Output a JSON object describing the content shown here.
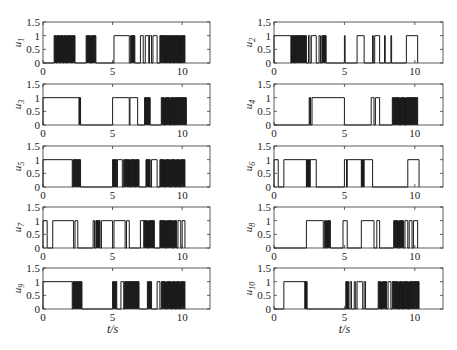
{
  "chart_data": {
    "type": "line",
    "layout": "5x2 grid of step-signal subplots",
    "xlabel": "t/s",
    "xlim": [
      0,
      12
    ],
    "ylim": [
      0,
      1.5
    ],
    "xticks": [
      0,
      5,
      10
    ],
    "xtick_labels": [
      "0",
      "5",
      "10"
    ],
    "yticks": [
      0,
      0.5,
      1,
      1.5
    ],
    "ytick_labels": [
      "0",
      "0.5",
      "1",
      "1.5"
    ],
    "grid": false,
    "legend": null,
    "colors": {
      "line": "#1a1a1a",
      "axes": "#333333",
      "background": "#ffffff"
    },
    "subplots": [
      {
        "ylabel": "u",
        "sub": "1",
        "col": 0,
        "row": 0,
        "on_intervals": [
          [
            0.8,
            0.95
          ],
          [
            1.0,
            1.15
          ],
          [
            1.2,
            1.45
          ],
          [
            1.5,
            1.7
          ],
          [
            1.75,
            2.05
          ],
          [
            2.1,
            2.3
          ],
          [
            3.1,
            3.4
          ],
          [
            3.5,
            3.8
          ],
          [
            5.1,
            6.2
          ],
          [
            6.3,
            6.6
          ],
          [
            7.0,
            7.2
          ],
          [
            7.35,
            7.6
          ],
          [
            7.65,
            7.8
          ],
          [
            7.9,
            8.2
          ],
          [
            8.4,
            8.8
          ],
          [
            8.85,
            9.1
          ],
          [
            9.15,
            9.4
          ],
          [
            9.45,
            9.7
          ],
          [
            9.75,
            9.9
          ],
          [
            9.95,
            10.2
          ]
        ],
        "dense_intervals": [
          [
            0.8,
            2.3
          ],
          [
            3.1,
            3.8
          ],
          [
            6.3,
            6.6
          ],
          [
            8.4,
            10.2
          ]
        ]
      },
      {
        "ylabel": "u",
        "sub": "2",
        "col": 1,
        "row": 0,
        "on_intervals": [
          [
            0,
            1.2
          ],
          [
            1.25,
            1.45
          ],
          [
            1.5,
            2.3
          ],
          [
            2.45,
            2.55
          ],
          [
            2.65,
            3.0
          ],
          [
            3.2,
            3.3
          ],
          [
            3.4,
            3.7
          ],
          [
            5.0,
            5.05
          ],
          [
            5.9,
            6.4
          ],
          [
            7.0,
            7.05
          ],
          [
            7.15,
            7.5
          ],
          [
            7.85,
            7.9
          ],
          [
            8.3,
            8.35
          ],
          [
            9.4,
            10.2
          ]
        ],
        "dense_intervals": [
          [
            1.2,
            2.3
          ],
          [
            3.4,
            3.7
          ]
        ]
      },
      {
        "ylabel": "u",
        "sub": "3",
        "col": 0,
        "row": 1,
        "on_intervals": [
          [
            0,
            2.6
          ],
          [
            2.6,
            2.7
          ],
          [
            5.0,
            6.2
          ],
          [
            6.25,
            6.8
          ],
          [
            7.3,
            7.7
          ],
          [
            8.5,
            8.7
          ],
          [
            8.8,
            9.1
          ],
          [
            9.2,
            9.4
          ],
          [
            9.45,
            10.3
          ]
        ],
        "dense_intervals": [
          [
            2.6,
            2.7
          ],
          [
            7.3,
            7.7
          ],
          [
            8.5,
            10.3
          ]
        ]
      },
      {
        "ylabel": "u",
        "sub": "4",
        "col": 1,
        "row": 1,
        "on_intervals": [
          [
            2.5,
            2.6
          ],
          [
            2.7,
            5.0
          ],
          [
            6.9,
            7.1
          ],
          [
            7.2,
            7.5
          ],
          [
            8.4,
            8.9
          ],
          [
            9.0,
            9.3
          ],
          [
            9.4,
            10.2
          ]
        ],
        "dense_intervals": [
          [
            2.5,
            2.6
          ],
          [
            8.4,
            10.2
          ]
        ]
      },
      {
        "ylabel": "u",
        "sub": "5",
        "col": 0,
        "row": 2,
        "on_intervals": [
          [
            0,
            2.1
          ],
          [
            2.15,
            2.7
          ],
          [
            5.0,
            5.3
          ],
          [
            5.35,
            5.7
          ],
          [
            5.8,
            6.2
          ],
          [
            6.3,
            6.6
          ],
          [
            6.65,
            6.9
          ],
          [
            7.4,
            7.7
          ],
          [
            7.8,
            8.2
          ],
          [
            8.4,
            8.7
          ],
          [
            8.8,
            9.1
          ],
          [
            9.2,
            9.5
          ],
          [
            9.6,
            9.8
          ],
          [
            9.9,
            10.2
          ]
        ],
        "dense_intervals": [
          [
            2.15,
            2.7
          ],
          [
            5.0,
            5.3
          ],
          [
            5.8,
            6.9
          ],
          [
            7.4,
            7.7
          ],
          [
            8.4,
            10.2
          ]
        ]
      },
      {
        "ylabel": "u",
        "sub": "6",
        "col": 1,
        "row": 2,
        "on_intervals": [
          [
            0,
            0.3
          ],
          [
            0.7,
            2.3
          ],
          [
            2.35,
            2.5
          ],
          [
            2.55,
            3.0
          ],
          [
            5.0,
            5.15
          ],
          [
            5.2,
            6.2
          ],
          [
            6.25,
            6.35
          ],
          [
            6.4,
            7.0
          ],
          [
            9.5,
            10.3
          ]
        ],
        "dense_intervals": [
          [
            2.3,
            2.6
          ],
          [
            6.2,
            6.4
          ]
        ]
      },
      {
        "ylabel": "u",
        "sub": "7",
        "col": 0,
        "row": 3,
        "on_intervals": [
          [
            0,
            0.3
          ],
          [
            0.7,
            2.2
          ],
          [
            2.3,
            2.5
          ],
          [
            3.6,
            3.7
          ],
          [
            3.8,
            4.1
          ],
          [
            4.2,
            5.0
          ],
          [
            5.1,
            5.9
          ],
          [
            6.0,
            6.2
          ],
          [
            7.0,
            7.5
          ],
          [
            7.6,
            8.0
          ],
          [
            8.4,
            8.8
          ],
          [
            8.9,
            9.3
          ],
          [
            9.4,
            9.6
          ],
          [
            9.7,
            9.9
          ],
          [
            10.0,
            10.2
          ]
        ],
        "dense_intervals": [
          [
            3.8,
            4.1
          ],
          [
            7.2,
            8.0
          ],
          [
            8.4,
            9.6
          ]
        ]
      },
      {
        "ylabel": "u",
        "sub": "8",
        "col": 1,
        "row": 3,
        "on_intervals": [
          [
            2.3,
            3.5
          ],
          [
            3.6,
            3.7
          ],
          [
            3.8,
            4.0
          ],
          [
            4.9,
            5.2
          ],
          [
            6.2,
            7.1
          ],
          [
            7.3,
            7.5
          ],
          [
            8.5,
            8.8
          ],
          [
            8.9,
            9.2
          ],
          [
            9.3,
            9.5
          ],
          [
            9.6,
            9.8
          ],
          [
            9.9,
            10.2
          ]
        ],
        "dense_intervals": [
          [
            3.6,
            4.0
          ],
          [
            8.5,
            9.2
          ]
        ]
      },
      {
        "ylabel": "u",
        "sub": "9",
        "col": 0,
        "row": 4,
        "on_intervals": [
          [
            0,
            2.1
          ],
          [
            2.15,
            2.8
          ],
          [
            5.0,
            5.3
          ],
          [
            5.6,
            5.8
          ],
          [
            5.85,
            6.9
          ],
          [
            7.5,
            7.8
          ],
          [
            8.2,
            8.4
          ],
          [
            8.5,
            8.8
          ],
          [
            8.9,
            9.2
          ],
          [
            9.3,
            9.5
          ],
          [
            9.6,
            9.8
          ],
          [
            9.9,
            10.2
          ]
        ],
        "dense_intervals": [
          [
            2.15,
            2.8
          ],
          [
            5.0,
            5.3
          ],
          [
            5.85,
            6.9
          ],
          [
            7.5,
            7.8
          ],
          [
            8.5,
            10.2
          ]
        ]
      },
      {
        "ylabel": "u",
        "sub": "10",
        "col": 1,
        "row": 4,
        "on_intervals": [
          [
            0.7,
            2.2
          ],
          [
            2.2,
            2.35
          ],
          [
            5.1,
            5.3
          ],
          [
            5.4,
            5.5
          ],
          [
            5.7,
            5.8
          ],
          [
            5.9,
            6.3
          ],
          [
            6.4,
            6.5
          ],
          [
            7.4,
            7.6
          ],
          [
            7.7,
            8.0
          ],
          [
            8.1,
            8.3
          ],
          [
            8.4,
            8.8
          ],
          [
            8.9,
            9.1
          ],
          [
            9.2,
            9.5
          ],
          [
            9.6,
            10.3
          ]
        ],
        "dense_intervals": [
          [
            2.2,
            2.35
          ],
          [
            5.1,
            5.3
          ],
          [
            7.4,
            8.0
          ],
          [
            8.4,
            10.3
          ]
        ]
      }
    ]
  },
  "axis_labels": {
    "left_xlabel": "t/s",
    "right_xlabel": "t/s"
  }
}
